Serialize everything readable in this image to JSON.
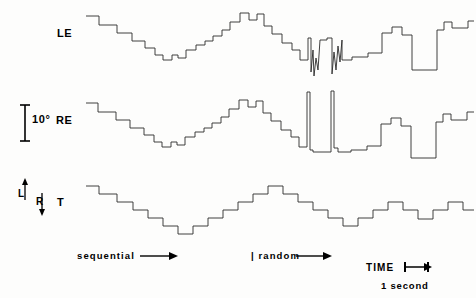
{
  "figure": {
    "background": "#fdfdfc",
    "trace_color": "#2b2b2b"
  },
  "labels": {
    "left_eye": "LE",
    "right_eye": "RE",
    "target": "T",
    "scale_value": "10°",
    "direction_left": "L",
    "direction_right": "R",
    "sequential": "sequential",
    "random": "| random",
    "time": "TIME",
    "one_second": "1 second"
  },
  "icons": {
    "scale_bar": "vertical-scale-bar-icon",
    "up_arrow": "arrow-up-icon",
    "down_arrow": "arrow-down-icon",
    "sequential_arrow": "arrow-right-icon",
    "random_arrow": "arrow-right-icon",
    "time_bar": "time-interval-bar-icon"
  },
  "chart_data": {
    "type": "line",
    "xlabel": "TIME",
    "ylabel": "Eye position (degrees)",
    "grid": false,
    "legend": "none",
    "axis_annotations": {
      "vertical_scale_bar_degrees": 10,
      "vertical_scale_bar_pixels": 36,
      "horizontal_scale_bar_label": "1 second",
      "horizontal_scale_bar_pixels": 26,
      "direction_up": "L",
      "direction_down": "R"
    },
    "phases": [
      {
        "name": "sequential",
        "label": "sequential",
        "x_start": 84,
        "x_end": 248
      },
      {
        "name": "random",
        "label": "random",
        "x_start": 252,
        "x_end": 470
      }
    ],
    "series": [
      {
        "name": "LE",
        "label": "Left Eye",
        "baseline_y": 48,
        "points": [
          [
            86,
            16
          ],
          [
            99,
            16
          ],
          [
            99,
            25
          ],
          [
            117,
            25
          ],
          [
            117,
            33
          ],
          [
            132,
            33
          ],
          [
            132,
            41
          ],
          [
            145,
            41
          ],
          [
            145,
            48
          ],
          [
            155,
            48
          ],
          [
            155,
            55
          ],
          [
            163,
            55
          ],
          [
            163,
            60
          ],
          [
            172,
            60
          ],
          [
            172,
            55
          ],
          [
            178,
            55
          ],
          [
            178,
            58
          ],
          [
            186,
            58
          ],
          [
            186,
            50
          ],
          [
            196,
            50
          ],
          [
            196,
            45
          ],
          [
            205,
            45
          ],
          [
            205,
            41
          ],
          [
            213,
            41
          ],
          [
            213,
            36
          ],
          [
            222,
            36
          ],
          [
            222,
            30
          ],
          [
            230,
            30
          ],
          [
            230,
            22
          ],
          [
            240,
            22
          ],
          [
            240,
            13
          ],
          [
            249,
            13
          ],
          [
            249,
            20
          ],
          [
            257,
            20
          ],
          [
            257,
            14
          ],
          [
            264,
            14
          ],
          [
            264,
            26
          ],
          [
            272,
            26
          ],
          [
            272,
            34
          ],
          [
            282,
            34
          ],
          [
            282,
            43
          ],
          [
            292,
            43
          ],
          [
            292,
            50
          ],
          [
            300,
            50
          ],
          [
            300,
            60
          ],
          [
            308,
            60
          ],
          [
            308,
            38
          ],
          [
            311,
            38
          ],
          [
            311,
            72
          ],
          [
            313,
            50
          ],
          [
            314,
            76
          ],
          [
            316,
            58
          ],
          [
            318,
            70
          ],
          [
            320,
            40
          ],
          [
            320,
            40
          ],
          [
            327,
            40
          ],
          [
            327,
            38
          ],
          [
            332,
            38
          ],
          [
            332,
            74
          ],
          [
            334,
            52
          ],
          [
            336,
            70
          ],
          [
            338,
            46
          ],
          [
            340,
            62
          ],
          [
            342,
            40
          ],
          [
            342,
            60
          ],
          [
            352,
            60
          ],
          [
            352,
            57
          ],
          [
            368,
            57
          ],
          [
            368,
            53
          ],
          [
            382,
            53
          ],
          [
            382,
            33
          ],
          [
            392,
            33
          ],
          [
            392,
            27
          ],
          [
            402,
            27
          ],
          [
            402,
            35
          ],
          [
            412,
            35
          ],
          [
            412,
            70
          ],
          [
            437,
            70
          ],
          [
            437,
            30
          ],
          [
            444,
            30
          ],
          [
            444,
            22
          ],
          [
            452,
            22
          ],
          [
            452,
            28
          ],
          [
            468,
            28
          ],
          [
            468,
            21
          ],
          [
            474,
            21
          ]
        ]
      },
      {
        "name": "RE",
        "label": "Right Eye",
        "baseline_y": 134,
        "points": [
          [
            86,
            103
          ],
          [
            98,
            103
          ],
          [
            98,
            112
          ],
          [
            116,
            112
          ],
          [
            116,
            120
          ],
          [
            130,
            120
          ],
          [
            130,
            128
          ],
          [
            144,
            128
          ],
          [
            144,
            135
          ],
          [
            154,
            135
          ],
          [
            154,
            142
          ],
          [
            162,
            142
          ],
          [
            162,
            147
          ],
          [
            171,
            147
          ],
          [
            171,
            142
          ],
          [
            177,
            142
          ],
          [
            177,
            145
          ],
          [
            185,
            145
          ],
          [
            185,
            137
          ],
          [
            195,
            137
          ],
          [
            195,
            132
          ],
          [
            204,
            132
          ],
          [
            204,
            128
          ],
          [
            212,
            128
          ],
          [
            212,
            123
          ],
          [
            221,
            123
          ],
          [
            221,
            117
          ],
          [
            229,
            117
          ],
          [
            229,
            109
          ],
          [
            239,
            109
          ],
          [
            239,
            100
          ],
          [
            248,
            100
          ],
          [
            248,
            107
          ],
          [
            256,
            107
          ],
          [
            256,
            101
          ],
          [
            263,
            101
          ],
          [
            263,
            113
          ],
          [
            271,
            113
          ],
          [
            271,
            121
          ],
          [
            281,
            121
          ],
          [
            281,
            130
          ],
          [
            291,
            130
          ],
          [
            291,
            137
          ],
          [
            299,
            137
          ],
          [
            299,
            147
          ],
          [
            307,
            147
          ],
          [
            307,
            92
          ],
          [
            310,
            92
          ],
          [
            310,
            150
          ],
          [
            313,
            150
          ],
          [
            313,
            152
          ],
          [
            320,
            152
          ],
          [
            320,
            152
          ],
          [
            331,
            152
          ],
          [
            331,
            91
          ],
          [
            334,
            91
          ],
          [
            334,
            148
          ],
          [
            338,
            148
          ],
          [
            338,
            152
          ],
          [
            351,
            152
          ],
          [
            351,
            150
          ],
          [
            367,
            150
          ],
          [
            367,
            146
          ],
          [
            381,
            146
          ],
          [
            381,
            124
          ],
          [
            391,
            124
          ],
          [
            391,
            118
          ],
          [
            401,
            118
          ],
          [
            401,
            126
          ],
          [
            411,
            126
          ],
          [
            411,
            158
          ],
          [
            436,
            158
          ],
          [
            436,
            122
          ],
          [
            443,
            122
          ],
          [
            443,
            114
          ],
          [
            451,
            114
          ],
          [
            451,
            120
          ],
          [
            467,
            120
          ],
          [
            467,
            112
          ],
          [
            474,
            112
          ]
        ]
      },
      {
        "name": "T",
        "label": "Target",
        "baseline_y": 214,
        "points": [
          [
            86,
            186
          ],
          [
            99,
            186
          ],
          [
            99,
            194
          ],
          [
            117,
            194
          ],
          [
            117,
            202
          ],
          [
            133,
            202
          ],
          [
            133,
            210
          ],
          [
            148,
            210
          ],
          [
            148,
            218
          ],
          [
            163,
            218
          ],
          [
            163,
            226
          ],
          [
            178,
            226
          ],
          [
            178,
            234
          ],
          [
            193,
            234
          ],
          [
            193,
            226
          ],
          [
            208,
            226
          ],
          [
            208,
            218
          ],
          [
            223,
            218
          ],
          [
            223,
            210
          ],
          [
            238,
            210
          ],
          [
            238,
            202
          ],
          [
            253,
            202
          ],
          [
            253,
            194
          ],
          [
            268,
            194
          ],
          [
            268,
            186
          ],
          [
            283,
            186
          ],
          [
            283,
            194
          ],
          [
            298,
            194
          ],
          [
            298,
            202
          ],
          [
            313,
            202
          ],
          [
            313,
            210
          ],
          [
            328,
            210
          ],
          [
            328,
            218
          ],
          [
            343,
            218
          ],
          [
            343,
            226
          ],
          [
            358,
            226
          ],
          [
            358,
            218
          ],
          [
            373,
            218
          ],
          [
            373,
            210
          ],
          [
            388,
            210
          ],
          [
            388,
            202
          ],
          [
            403,
            202
          ],
          [
            403,
            210
          ],
          [
            418,
            210
          ],
          [
            418,
            219
          ],
          [
            433,
            219
          ],
          [
            433,
            210
          ],
          [
            448,
            210
          ],
          [
            448,
            202
          ],
          [
            463,
            202
          ],
          [
            463,
            210
          ],
          [
            474,
            210
          ]
        ]
      }
    ]
  }
}
